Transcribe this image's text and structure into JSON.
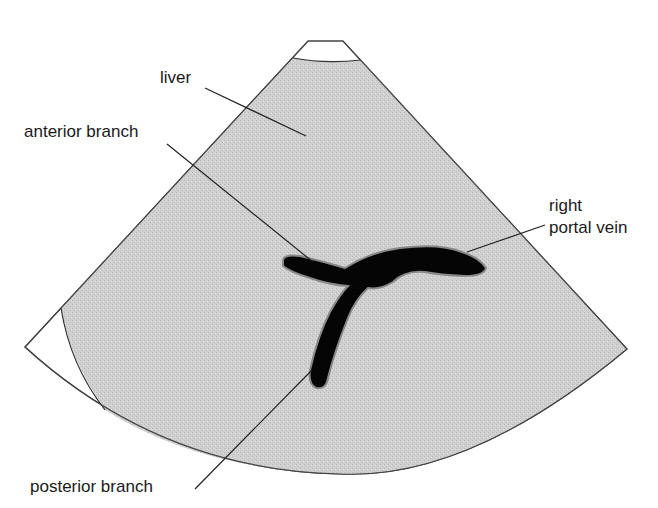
{
  "diagram": {
    "labels": {
      "liver": "liver",
      "anterior_branch": "anterior branch",
      "right_portal_vein_line1": "right",
      "right_portal_vein_line2": "portal vein",
      "posterior_branch": "posterior branch"
    },
    "colors": {
      "tissue_fill": "#cfcfcf",
      "vessel_fill": "#050505",
      "outline": "#333333",
      "background": "#ffffff"
    }
  }
}
